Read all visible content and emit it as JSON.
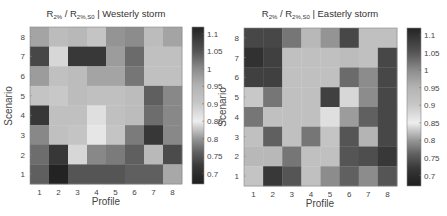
{
  "chart_data": [
    {
      "type": "heatmap",
      "title": {
        "main": "R",
        "sub1": "2%",
        "sep": " / R",
        "sub2": "2%,S0",
        "suffix": " | Westerly storm"
      },
      "xlabel": "Profile",
      "ylabel": "Scenario",
      "x_categories": [
        "1",
        "2",
        "3",
        "4",
        "5",
        "6",
        "7",
        "8"
      ],
      "y_categories": [
        "1",
        "2",
        "3",
        "4",
        "5",
        "6",
        "7",
        "8"
      ],
      "values_rows_top_to_bottom": [
        [
          0.97,
          0.93,
          0.94,
          0.91,
          0.99,
          1.0,
          0.93,
          0.97
        ],
        [
          1.07,
          0.88,
          1.09,
          1.09,
          0.98,
          1.03,
          0.92,
          0.92
        ],
        [
          0.98,
          0.92,
          0.93,
          0.97,
          0.97,
          1.02,
          0.92,
          0.92
        ],
        [
          0.91,
          0.9,
          0.93,
          0.92,
          0.92,
          0.93,
          0.76,
          0.79
        ],
        [
          0.72,
          0.92,
          0.92,
          0.87,
          0.92,
          0.93,
          0.77,
          0.79
        ],
        [
          0.79,
          0.92,
          0.91,
          0.86,
          0.91,
          0.78,
          0.72,
          0.79
        ],
        [
          0.77,
          0.72,
          0.88,
          0.79,
          0.78,
          0.76,
          0.82,
          0.74
        ],
        [
          0.76,
          0.68,
          0.75,
          0.75,
          0.75,
          0.76,
          0.76,
          0.81
        ]
      ],
      "colorbar": {
        "range": [
          0.67,
          1.12
        ],
        "ticks": [
          "1.1",
          "1.05",
          "1",
          "0.95",
          "0.9",
          "0.85",
          "0.8",
          "0.75",
          "0.7"
        ]
      }
    },
    {
      "type": "heatmap",
      "title": {
        "main": "R",
        "sub1": "2%",
        "sep": " / R",
        "sub2": "2%,S0",
        "suffix": " | Easterly storm"
      },
      "xlabel": "Profile",
      "ylabel": "Scenario",
      "x_categories": [
        "1",
        "2",
        "3",
        "4",
        "5",
        "6",
        "7",
        "8"
      ],
      "y_categories": [
        "1",
        "2",
        "3",
        "4",
        "5",
        "6",
        "7",
        "8"
      ],
      "values_rows_top_to_bottom": [
        [
          1.07,
          1.07,
          1.02,
          0.94,
          0.99,
          1.07,
          0.92,
          0.92
        ],
        [
          1.1,
          1.08,
          0.92,
          0.92,
          0.92,
          0.93,
          0.92,
          1.07
        ],
        [
          1.08,
          1.08,
          0.92,
          0.92,
          0.92,
          1.03,
          1.0,
          1.07
        ],
        [
          0.9,
          1.02,
          0.92,
          0.92,
          1.08,
          0.88,
          1.0,
          1.07
        ],
        [
          1.02,
          0.92,
          0.92,
          0.92,
          0.87,
          0.98,
          1.04,
          1.07
        ],
        [
          0.92,
          1.04,
          0.92,
          1.02,
          0.91,
          1.05,
          0.95,
          1.07
        ],
        [
          0.94,
          0.94,
          1.02,
          0.92,
          0.92,
          1.05,
          1.06,
          1.09
        ],
        [
          0.91,
          1.09,
          1.05,
          0.92,
          1.0,
          1.04,
          1.0,
          1.05
        ]
      ],
      "colorbar": {
        "range": [
          0.67,
          1.12
        ],
        "ticks": [
          "1.1",
          "1.05",
          "1",
          "0.95",
          "0.9",
          "0.85",
          "0.8",
          "0.75",
          "0.7"
        ]
      }
    }
  ]
}
